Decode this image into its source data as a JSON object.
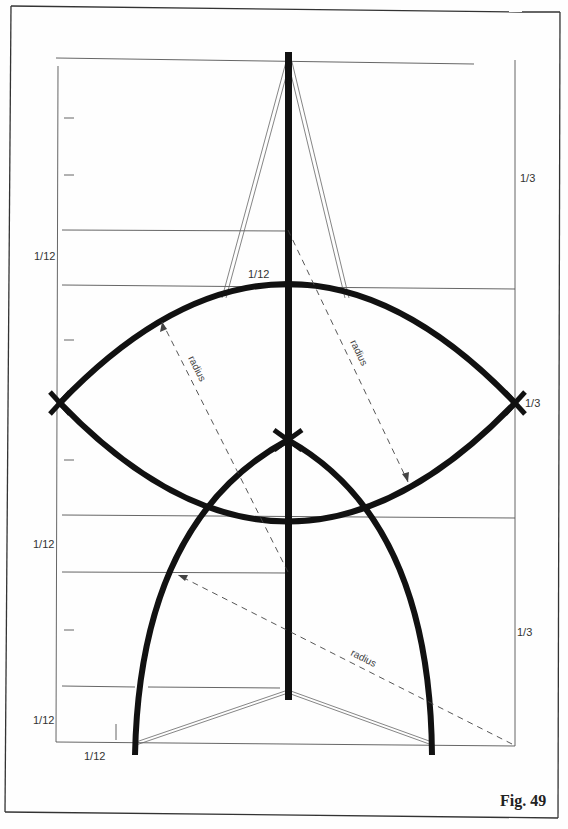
{
  "figure": {
    "caption": "Fig. 49",
    "labels": {
      "left_upper": "1/12",
      "left_middle": "1/12",
      "left_lower": "1/12",
      "bottom_left": "1/12",
      "top_center": "1/12",
      "right_upper": "1/3",
      "right_middle": "1/3",
      "right_lower": "1/3"
    },
    "radius_labels": [
      "radius",
      "radius",
      "radius"
    ],
    "colors": {
      "ink": "#111111",
      "thin_line": "#555555",
      "background": "#fefefe"
    }
  }
}
